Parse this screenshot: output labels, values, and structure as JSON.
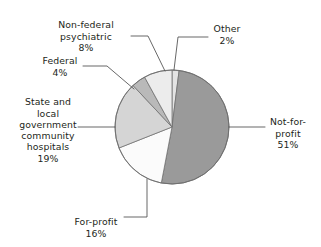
{
  "chart_data": {
    "type": "pie",
    "title": "",
    "subtitle": "",
    "xlabel": "",
    "ylabel": "",
    "legend_position": "none",
    "grid": false,
    "units": "%",
    "total": 100,
    "start_angle_deg": 0,
    "direction": "clockwise",
    "categories": [
      "Other",
      "Not-for-profit",
      "For-profit",
      "State and local government community hospitals",
      "Federal",
      "Non-federal psychiatric"
    ],
    "values": [
      2,
      51,
      16,
      19,
      4,
      8
    ],
    "colors": [
      "#e3e3e3",
      "#9a9a9a",
      "#fbfbfb",
      "#d5d5d5",
      "#b9b9b9",
      "#ececec"
    ],
    "slices": [
      {
        "name": "Other",
        "label": "Other",
        "value": 2,
        "percent_text": "2%",
        "color": "#e3e3e3"
      },
      {
        "name": "Not-for-profit",
        "label": "Not-for-\nprofit",
        "value": 51,
        "percent_text": "51%",
        "color": "#9a9a9a"
      },
      {
        "name": "For-profit",
        "label": "For-profit",
        "value": 16,
        "percent_text": "16%",
        "color": "#fbfbfb"
      },
      {
        "name": "State and local government community hospitals",
        "label": "State and\nlocal\ngovernment\ncommunity\nhospitals",
        "value": 19,
        "percent_text": "19%",
        "color": "#d5d5d5"
      },
      {
        "name": "Federal",
        "label": "Federal",
        "value": 4,
        "percent_text": "4%",
        "color": "#b9b9b9"
      },
      {
        "name": "Non-federal psychiatric",
        "label": "Non-federal\npsychiatric",
        "value": 8,
        "percent_text": "8%",
        "color": "#ececec"
      }
    ]
  },
  "labels": {
    "other": {
      "text": "Other",
      "percent": "2%"
    },
    "notforprofit": {
      "text": "Not-for-\nprofit",
      "percent": "51%"
    },
    "forprofit": {
      "text": "For-profit",
      "percent": "16%"
    },
    "statelocal": {
      "text": "State and\nlocal\ngovernment\ncommunity\nhospitals",
      "percent": "19%"
    },
    "federal": {
      "text": "Federal",
      "percent": "4%"
    },
    "nonfederal": {
      "text": "Non-federal\npsychiatric",
      "percent": "8%"
    }
  },
  "style": {
    "outline_color": "#6d6d6d",
    "leader_color": "#4d4d4d",
    "text_color": "#231f20",
    "background": "#ffffff"
  }
}
